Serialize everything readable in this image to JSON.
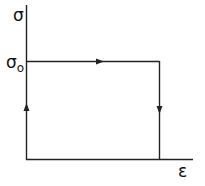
{
  "diagram": {
    "type": "stress-strain-loop",
    "y_axis_label": "σ",
    "x_axis_label": "ε",
    "level_label": "σ",
    "level_subscript": "o",
    "line_color": "#222222",
    "path": [
      {
        "from": "origin",
        "to": "(0, σo)",
        "direction": "up"
      },
      {
        "from": "(0, σo)",
        "to": "(ε1, σo)",
        "direction": "right"
      },
      {
        "from": "(ε1, σo)",
        "to": "(ε1, 0)",
        "direction": "down"
      }
    ]
  }
}
